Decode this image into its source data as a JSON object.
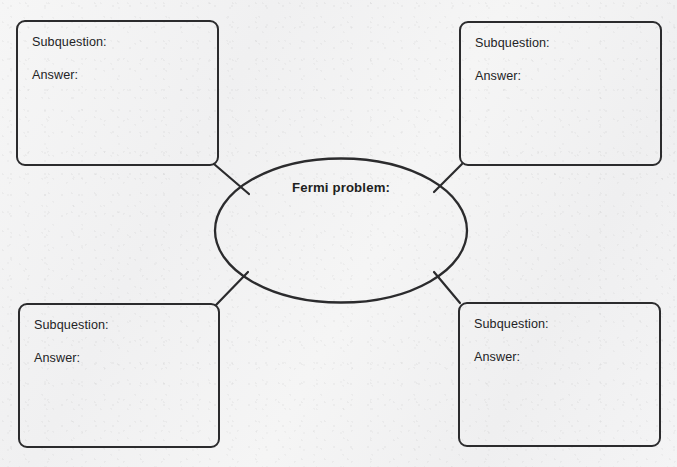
{
  "document": {
    "type": "graphic-organizer-worksheet",
    "center": {
      "label": "Fermi problem:"
    },
    "labels": {
      "subquestion": "Subquestion:",
      "answer": "Answer:"
    },
    "nodes": [
      {
        "id": "top-left",
        "position": "top-left",
        "subquestion_label": "Subquestion:",
        "answer_label": "Answer:",
        "subquestion_value": "",
        "answer_value": ""
      },
      {
        "id": "top-right",
        "position": "top-right",
        "subquestion_label": "Subquestion:",
        "answer_label": "Answer:",
        "subquestion_value": "",
        "answer_value": ""
      },
      {
        "id": "bottom-left",
        "position": "bottom-left",
        "subquestion_label": "Subquestion:",
        "answer_label": "Answer:",
        "subquestion_value": "",
        "answer_value": ""
      },
      {
        "id": "bottom-right",
        "position": "bottom-right",
        "subquestion_label": "Subquestion:",
        "answer_label": "Answer:",
        "subquestion_value": "",
        "answer_value": ""
      }
    ],
    "colors": {
      "ink": "#2b2b2d",
      "text": "#232325",
      "paper": "#f3f3f3"
    }
  }
}
